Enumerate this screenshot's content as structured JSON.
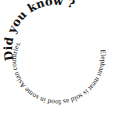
{
  "spiral": {
    "heading": "Did you know ?",
    "body": "Elephant meat is sold as food in some Asian countries.",
    "text_color": "#111111",
    "background": "#ffffff"
  }
}
